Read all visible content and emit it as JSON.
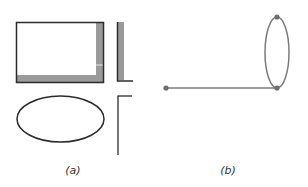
{
  "panels": [
    {
      "id": "a",
      "label": "(a)",
      "shapes": [
        {
          "type": "rectangle",
          "description": "rectangle with shaded right and bottom edges"
        },
        {
          "type": "l-shape",
          "description": "L-shaped corner with shaded band"
        },
        {
          "type": "ellipse",
          "description": "horizontal ellipse outline"
        },
        {
          "type": "inverted-l",
          "description": "inverted L corner line"
        }
      ]
    },
    {
      "id": "b",
      "label": "(b)",
      "graph": {
        "nodes": [
          {
            "id": "n1",
            "x": 166,
            "y": 88
          },
          {
            "id": "n2",
            "x": 277,
            "y": 88
          },
          {
            "id": "n3",
            "x": 277,
            "y": 17
          }
        ],
        "edges": [
          {
            "from": "n1",
            "to": "n2",
            "type": "line"
          },
          {
            "from": "n2",
            "to": "n3",
            "type": "arc-left"
          },
          {
            "from": "n3",
            "to": "n2",
            "type": "arc-right"
          }
        ]
      }
    }
  ],
  "colors": {
    "stroke_dark": "#2b2b2b",
    "shade_gray": "#9a9a9a",
    "graph_gray": "#7a7a7a"
  }
}
